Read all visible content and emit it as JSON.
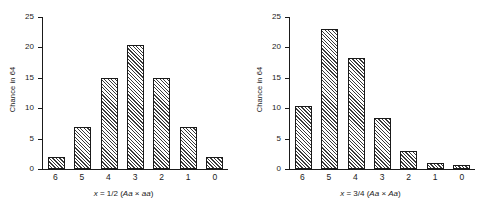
{
  "figure": {
    "panels": [
      {
        "id": "left-panel",
        "ylabel": "Chance in 64",
        "caption_prefix": "x",
        "caption_mid": " = 1/2 (",
        "caption_genotype_a": "Aa",
        "caption_cross": " × ",
        "caption_genotype_b": "aa",
        "caption_suffix": ")"
      },
      {
        "id": "right-panel",
        "ylabel": "Chance in 64",
        "caption_prefix": "x",
        "caption_mid": " = 3/4 (",
        "caption_genotype_a": "Aa",
        "caption_cross": " × ",
        "caption_genotype_b": "Aa",
        "caption_suffix": ")"
      }
    ]
  },
  "chart_data": [
    {
      "type": "bar",
      "id": "left-chart",
      "title": "",
      "xlabel": "x = 1/2 (Aa × aa)",
      "ylabel": "Chance in 64",
      "categories": [
        "6",
        "5",
        "4",
        "3",
        "2",
        "1",
        "0"
      ],
      "values": [
        2,
        7,
        15,
        20.5,
        15,
        7,
        2
      ],
      "ylim": [
        0,
        25
      ],
      "yticks": [
        0,
        5,
        10,
        15,
        20,
        25
      ],
      "ytick_labels": [
        "0",
        "5",
        "10",
        "15",
        "20",
        "25"
      ],
      "grid": false,
      "legend": "none",
      "bar_fill": "diagonal-hatch",
      "bar_edge_color": "#1a1a1a"
    },
    {
      "type": "bar",
      "id": "right-chart",
      "title": "",
      "xlabel": "x = 3/4 (Aa × Aa)",
      "ylabel": "Chance in 64",
      "categories": [
        "6",
        "5",
        "4",
        "3",
        "2",
        "1",
        "0"
      ],
      "values": [
        10.5,
        23.2,
        18.4,
        8.4,
        3,
        1,
        0.6
      ],
      "ylim": [
        0,
        25
      ],
      "yticks": [
        0,
        5,
        10,
        15,
        20,
        25
      ],
      "ytick_labels": [
        "0",
        "5",
        "10",
        "15",
        "20",
        "25"
      ],
      "grid": false,
      "legend": "none",
      "bar_fill": "diagonal-hatch",
      "bar_edge_color": "#1a1a1a"
    }
  ]
}
